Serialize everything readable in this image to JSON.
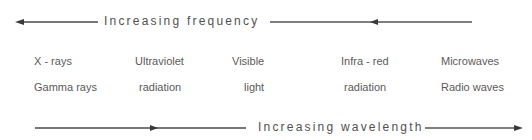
{
  "diagram": {
    "top_axis": {
      "label": "Increasing frequency",
      "direction": "left"
    },
    "bottom_axis": {
      "label": "Increasing wavelength",
      "direction": "right"
    },
    "bands": [
      {
        "line1": "X - rays",
        "line2": "Gamma rays"
      },
      {
        "line1": "Ultraviolet",
        "line2": "radiation"
      },
      {
        "line1": "Visible",
        "line2": "light"
      },
      {
        "line1": "Infra - red",
        "line2": "radiation"
      },
      {
        "line1": "Microwaves",
        "line2": "Radio waves"
      }
    ],
    "colors": {
      "line": "#4a4a4a",
      "text": "#5a5a5a"
    }
  }
}
